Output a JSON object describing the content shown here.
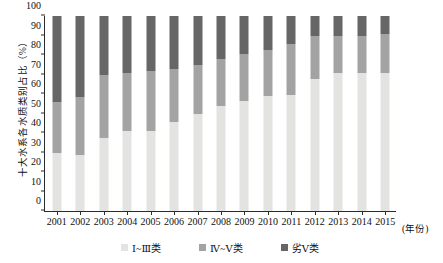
{
  "chart_data": {
    "type": "bar",
    "title": "",
    "subtitle": "",
    "xlabel": "(年份)",
    "ylabel": "十大水系各水质类别占比（%）",
    "ylim": [
      0,
      100
    ],
    "yticks": [
      0,
      10,
      20,
      30,
      40,
      50,
      60,
      70,
      80,
      90,
      100
    ],
    "grid": false,
    "stacked": true,
    "legend_position": "bottom-center",
    "categories": [
      "2001",
      "2002",
      "2003",
      "2004",
      "2005",
      "2006",
      "2007",
      "2008",
      "2009",
      "2010",
      "2011",
      "2012",
      "2013",
      "2014",
      "2015"
    ],
    "series": [
      {
        "name": "Ⅰ~Ⅲ类",
        "color": "#e3e3e1",
        "values": [
          29.5,
          28.5,
          37.5,
          41,
          41,
          45.5,
          49.5,
          54,
          56.5,
          59,
          59.5,
          67.5,
          71,
          71,
          71
        ]
      },
      {
        "name": "Ⅳ~Ⅴ类",
        "color": "#a3a3a3",
        "values": [
          26.5,
          30,
          32.5,
          30,
          31,
          27.5,
          25.5,
          24,
          24,
          23.5,
          26,
          22,
          19,
          19,
          20
        ]
      },
      {
        "name": "劣Ⅴ类",
        "color": "#666666",
        "values": [
          44,
          41.5,
          30,
          29,
          28,
          27,
          25,
          22,
          19.5,
          17.5,
          14.5,
          10.5,
          10,
          10,
          9
        ]
      }
    ],
    "cumulative_tops": {
      "lower_boundary": [
        29.5,
        28.5,
        37.5,
        41,
        41,
        45.5,
        49.5,
        54,
        56.5,
        59,
        59.5,
        67.5,
        71,
        71,
        71
      ],
      "upper_boundary": [
        56,
        58.5,
        70,
        71,
        72,
        73,
        75,
        78,
        80.5,
        82.5,
        85.5,
        89.5,
        90,
        90,
        91
      ]
    }
  },
  "legend": {
    "items": [
      {
        "label": "Ⅰ~Ⅲ类",
        "color": "#e3e3e1"
      },
      {
        "label": "Ⅳ~Ⅴ类",
        "color": "#a3a3a3"
      },
      {
        "label": "劣Ⅴ类",
        "color": "#666666"
      }
    ]
  },
  "axes": {
    "y_title": "十大水系各水质类别占比（%）",
    "x_unit": "(年份)"
  }
}
